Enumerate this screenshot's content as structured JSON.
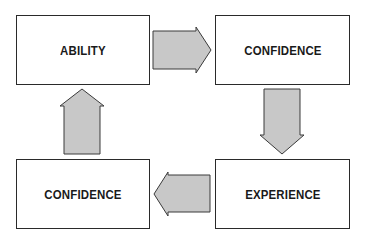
{
  "diagram": {
    "type": "cycle",
    "nodes": [
      {
        "id": "top-left",
        "label": "ABILITY"
      },
      {
        "id": "top-right",
        "label": "CONFIDENCE"
      },
      {
        "id": "bottom-right",
        "label": "EXPERIENCE"
      },
      {
        "id": "bottom-left",
        "label": "CONFIDENCE"
      }
    ],
    "edges": [
      {
        "from": "top-left",
        "to": "top-right",
        "direction": "right"
      },
      {
        "from": "top-right",
        "to": "bottom-right",
        "direction": "down"
      },
      {
        "from": "bottom-right",
        "to": "bottom-left",
        "direction": "left"
      },
      {
        "from": "bottom-left",
        "to": "top-left",
        "direction": "up"
      }
    ],
    "colors": {
      "arrow_fill": "#c8c8c8",
      "arrow_stroke": "#3a3a3a",
      "box_border": "#2a2a2a",
      "text": "#1a1a1a"
    }
  }
}
